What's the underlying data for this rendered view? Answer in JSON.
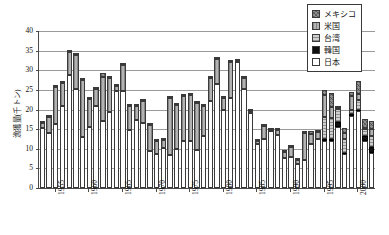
{
  "chart_data": {
    "type": "bar",
    "stacked": true,
    "title": "",
    "xlabel": "",
    "ylabel": "漁獲量(千トン)",
    "ylim": [
      0,
      40
    ],
    "ytick_step": 5,
    "yticks": [
      0,
      5,
      10,
      15,
      20,
      25,
      30,
      35,
      40
    ],
    "grid": true,
    "legend_position": "top-right",
    "x_tick_labels": [
      "1955",
      "1960",
      "1965",
      "1970",
      "1975",
      "1980",
      "1985",
      "1990",
      "1995",
      "2000"
    ],
    "x_tick_years": [
      1955,
      1960,
      1965,
      1970,
      1975,
      1980,
      1985,
      1990,
      1995,
      2000
    ],
    "categories": [
      1953,
      1954,
      1955,
      1956,
      1957,
      1958,
      1959,
      1960,
      1961,
      1962,
      1963,
      1964,
      1965,
      1966,
      1967,
      1968,
      1969,
      1970,
      1971,
      1972,
      1973,
      1974,
      1975,
      1976,
      1977,
      1978,
      1979,
      1980,
      1981,
      1982,
      1983,
      1984,
      1985,
      1986,
      1987,
      1988,
      1989,
      1990,
      1991,
      1992,
      1993,
      1994,
      1995,
      1996,
      1997,
      1998,
      1999,
      2000,
      2001,
      2002
    ],
    "series": [
      {
        "name": "日本",
        "key": "jp",
        "color": "#ffffff",
        "values": [
          15.2,
          14.0,
          16.3,
          21.0,
          28.7,
          25.3,
          13.1,
          15.6,
          21.0,
          17.1,
          19.4,
          24.8,
          24.6,
          14.9,
          17.4,
          16.5,
          9.4,
          8.6,
          10.2,
          8.4,
          10.0,
          12.0,
          11.9,
          9.8,
          13.3,
          22.2,
          26.6,
          20.0,
          23.0,
          32.1,
          25.2,
          19.2,
          11.1,
          12.4,
          14.6,
          13.5,
          7.6,
          7.8,
          6.2,
          7.1,
          11.1,
          12.6,
          12.0,
          12.0,
          15.5,
          8.6,
          18.3,
          19.5,
          12.0,
          9.0
        ]
      },
      {
        "name": "韓国",
        "key": "kr",
        "color": "#101010",
        "values": [
          0,
          0,
          0,
          0,
          0,
          0,
          0,
          0,
          0,
          0,
          0,
          0,
          0,
          0,
          0,
          0,
          0,
          0,
          0,
          0,
          0,
          0,
          0,
          0,
          0,
          0,
          0,
          0,
          0,
          0,
          0,
          0,
          0,
          0,
          0,
          0,
          0,
          0,
          0,
          0,
          0,
          0,
          0.5,
          0.6,
          1.2,
          0.3,
          0.6,
          0.5,
          1.2,
          1.5
        ]
      },
      {
        "name": "台湾",
        "key": "tw",
        "color": "#cfcfcf",
        "values": [
          0,
          0,
          0,
          0,
          0,
          0,
          0,
          0,
          0,
          0,
          0,
          0,
          0,
          0,
          0,
          0,
          0,
          0,
          0,
          0,
          0,
          0,
          0,
          0,
          0,
          0,
          0,
          0,
          0,
          0,
          0,
          0,
          0,
          0,
          0,
          0,
          0,
          0,
          0,
          0,
          0,
          0,
          5.5,
          5.2,
          3.5,
          3.5,
          1.1,
          2.4,
          1.8,
          2.8
        ]
      },
      {
        "name": "米国",
        "key": "us",
        "color": "#b3b3b3",
        "values": [
          1.3,
          4.0,
          9.4,
          5.8,
          5.9,
          8.6,
          14.5,
          7.0,
          4.2,
          11.1,
          8.7,
          1.3,
          6.8,
          6.0,
          3.5,
          5.7,
          6.6,
          3.5,
          2.0,
          14.5,
          11.2,
          11.5,
          11.7,
          11.8,
          7.5,
          5.8,
          6.2,
          3.0,
          9.0,
          0.3,
          2.8,
          0.3,
          0.8,
          3.5,
          0.2,
          1.2,
          1.6,
          2.6,
          0.9,
          6.9,
          2.6,
          1.6,
          5.6,
          2.9,
          0.3,
          1.5,
          3.5,
          1.6,
          0.4,
          1.8
        ]
      },
      {
        "name": "メキシコ",
        "key": "mx",
        "color": "#8f8f8f",
        "values": [
          0.5,
          0.3,
          0.3,
          0.4,
          0.3,
          0.3,
          0.2,
          0.2,
          0.2,
          1.2,
          0.2,
          0.2,
          0.2,
          0.3,
          0.2,
          0.4,
          0.2,
          0.3,
          0.2,
          0.6,
          0.4,
          0.4,
          0.3,
          0.4,
          0.2,
          0.3,
          0.2,
          0.2,
          0.2,
          0.1,
          0.2,
          0.1,
          0.1,
          0.1,
          0.2,
          0.2,
          0.2,
          0.1,
          0.1,
          0.3,
          0.8,
          0.2,
          1.4,
          3.5,
          0.3,
          1.4,
          1.0,
          3.2,
          2.1,
          1.9
        ]
      }
    ]
  },
  "legend": {
    "items": [
      {
        "label": "メキシコ",
        "key": "mx"
      },
      {
        "label": "米国",
        "key": "us"
      },
      {
        "label": "台湾",
        "key": "tw"
      },
      {
        "label": "韓国",
        "key": "kr"
      },
      {
        "label": "日本",
        "key": "jp"
      }
    ]
  }
}
